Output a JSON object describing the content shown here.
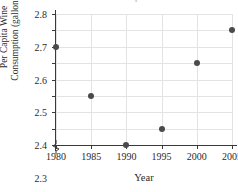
{
  "chart_data": {
    "type": "scatter",
    "title": "Wine Consumption",
    "xlabel": "Year",
    "ylabel_lines": [
      "Per Capita Wine",
      "Consumption (gallons)"
    ],
    "ylabel": "Per Capita Wine Consumption (gallons)",
    "x": [
      1980,
      1985,
      1990,
      1995,
      2000,
      2005
    ],
    "values": [
      2.6,
      2.3,
      2.0,
      2.1,
      2.5,
      2.7
    ],
    "points": [
      {
        "x": 1980,
        "y": 2.6
      },
      {
        "x": 1985,
        "y": 2.3
      },
      {
        "x": 1990,
        "y": 2.0
      },
      {
        "x": 1995,
        "y": 2.1
      },
      {
        "x": 2000,
        "y": 2.5
      },
      {
        "x": 2005,
        "y": 2.7
      }
    ],
    "xlim": [
      1980,
      2005
    ],
    "ylim": [
      2.0,
      2.8
    ],
    "xticks": [
      "1980",
      "1985",
      "1990",
      "1995",
      "2000",
      "2005"
    ],
    "yticks": [
      "2.0",
      "2.1",
      "2.2",
      "2.3",
      "2.4",
      "2.5",
      "2.6",
      "2.7",
      "2.8"
    ],
    "grid": true,
    "legend": null,
    "y_axis_break": true,
    "marker_color": "#4a4a4a",
    "grid_color": "#e3e3e3",
    "axis_color": "#3a3a3a"
  }
}
